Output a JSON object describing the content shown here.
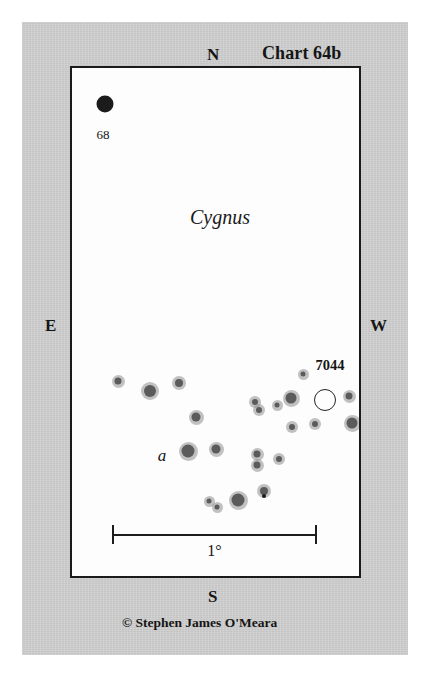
{
  "chart_data": {
    "type": "scatter",
    "title": "Chart 64b",
    "subtitle": "Cygnus",
    "xlabel": "",
    "ylabel": "",
    "grid": false,
    "legend_position": "none",
    "projection_note": "star chart; N up, S down, E left, W right",
    "field_size_px": {
      "width": 291,
      "height": 512
    },
    "scale_bar": {
      "label": "1°",
      "length_px": 205,
      "degrees": 1
    },
    "compass": {
      "north": "N",
      "south": "S",
      "east": "E",
      "west": "W"
    },
    "annotations": [
      {
        "name": "constellation-name",
        "text": "Cygnus",
        "x": 118,
        "y": 138,
        "style": "italic"
      },
      {
        "name": "star-label-68",
        "text": "68",
        "x": 31,
        "y": 66,
        "style": "plain"
      },
      {
        "name": "star-label-a",
        "text": "a",
        "x": 90,
        "y": 387,
        "style": "italic"
      },
      {
        "name": "cluster-label-7044",
        "text": "7044",
        "x": 258,
        "y": 297,
        "style": "boldnum"
      }
    ],
    "objects": [
      {
        "name": "open-cluster-7044",
        "kind": "open_cluster",
        "symbol": "open_circle",
        "x": 253,
        "y": 332,
        "size": 20
      }
    ],
    "stars": [
      {
        "id": "68-cyg",
        "x": 33,
        "y": 36,
        "mag_size": 17,
        "halo": false
      },
      {
        "id": "s01",
        "x": 46,
        "y": 313,
        "mag_size": 7,
        "halo": true
      },
      {
        "id": "s02",
        "x": 78,
        "y": 323,
        "mag_size": 12,
        "halo": true
      },
      {
        "id": "s03",
        "x": 107,
        "y": 315,
        "mag_size": 8,
        "halo": true
      },
      {
        "id": "s04",
        "x": 124,
        "y": 349,
        "mag_size": 9,
        "halo": true
      },
      {
        "id": "s05",
        "x": 144,
        "y": 381,
        "mag_size": 9,
        "halo": true
      },
      {
        "id": "s06",
        "x": 116,
        "y": 383,
        "mag_size": 13,
        "halo": true
      },
      {
        "id": "s07",
        "x": 137,
        "y": 433,
        "mag_size": 5,
        "halo": true
      },
      {
        "id": "s08",
        "x": 145,
        "y": 439,
        "mag_size": 5,
        "halo": true
      },
      {
        "id": "s09",
        "x": 166,
        "y": 432,
        "mag_size": 13,
        "halo": true
      },
      {
        "id": "s10",
        "x": 192,
        "y": 423,
        "mag_size": 8,
        "halo": true
      },
      {
        "id": "s11",
        "x": 192,
        "y": 428,
        "mag_size": 4,
        "halo": false
      },
      {
        "id": "s12",
        "x": 183,
        "y": 334,
        "mag_size": 6,
        "halo": true
      },
      {
        "id": "s13",
        "x": 187,
        "y": 342,
        "mag_size": 6,
        "halo": true
      },
      {
        "id": "s14",
        "x": 185,
        "y": 386,
        "mag_size": 7,
        "halo": true
      },
      {
        "id": "s15",
        "x": 185,
        "y": 397,
        "mag_size": 7,
        "halo": true
      },
      {
        "id": "s16",
        "x": 207,
        "y": 391,
        "mag_size": 6,
        "halo": true
      },
      {
        "id": "s17",
        "x": 231,
        "y": 306,
        "mag_size": 5,
        "halo": true
      },
      {
        "id": "s18",
        "x": 219,
        "y": 330,
        "mag_size": 11,
        "halo": true
      },
      {
        "id": "s19",
        "x": 205,
        "y": 337,
        "mag_size": 5,
        "halo": true
      },
      {
        "id": "s20",
        "x": 277,
        "y": 328,
        "mag_size": 7,
        "halo": true
      },
      {
        "id": "s21",
        "x": 220,
        "y": 359,
        "mag_size": 6,
        "halo": true
      },
      {
        "id": "s22",
        "x": 243,
        "y": 356,
        "mag_size": 6,
        "halo": true
      },
      {
        "id": "s23",
        "x": 280,
        "y": 355,
        "mag_size": 11,
        "halo": true
      }
    ]
  },
  "header": {
    "chart_title": "Chart 64b"
  },
  "footer": {
    "credit": "© Stephen James O'Meara"
  },
  "colors": {
    "mat": "#c9c9c9",
    "field": "#fdfdfd",
    "ink": "#1a1a1a",
    "halo": "#8f8f8f"
  }
}
